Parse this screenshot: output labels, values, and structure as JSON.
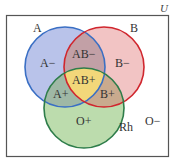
{
  "diagram": {
    "type": "venn",
    "universe_label": "U",
    "sets": [
      {
        "name": "A",
        "label": "A",
        "color": "#3a6fc4",
        "fill": "#b9c3ea"
      },
      {
        "name": "B",
        "label": "B",
        "color": "#d0262e",
        "fill": "#f2c4c4"
      },
      {
        "name": "Rh",
        "label": "Rh",
        "color": "#2e7d4a",
        "fill": "#bcdcad"
      }
    ],
    "regions": {
      "a_only": "A−",
      "b_only": "B−",
      "ab_only": "AB−",
      "ab_rh": "AB+",
      "a_rh": "A+",
      "b_rh": "B+",
      "rh_only": "O+",
      "outside": "O−"
    },
    "colors": {
      "border": "#555555",
      "ab_fill": "#c2a0a6",
      "center_fill": "#f2d77a",
      "a_rh_fill": "#9fb8a5",
      "b_rh_fill": "#c9aa8e"
    }
  }
}
